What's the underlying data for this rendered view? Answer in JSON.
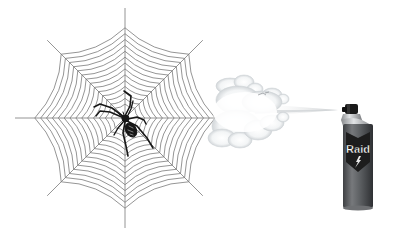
{
  "scene": {
    "description": "Illustration of a spider on a web being sprayed with insecticide from an aerosol can",
    "background_color": "#ffffff"
  },
  "web": {
    "center": [
      125,
      118
    ],
    "radius": 110,
    "spokes": 8,
    "rings": 14,
    "line_color": "#7a7a7a"
  },
  "spider": {
    "position": [
      127,
      120
    ],
    "color": "#1a1a1a"
  },
  "spray_cloud": {
    "color": "#e9ecef",
    "shadow_color": "#c4c8cc"
  },
  "can": {
    "brand_label": "Raid",
    "body_color": "#5a5d60",
    "shield_color": "#1d1d1d",
    "cap_color": "#1a1a1a",
    "collar_color": "#b9bcbf"
  }
}
